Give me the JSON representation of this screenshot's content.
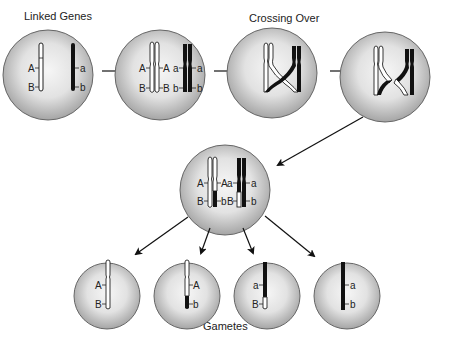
{
  "diagram": {
    "labels": {
      "linked_genes": "Linked Genes",
      "crossing_over": "Crossing Over",
      "gametes": "Gametes"
    },
    "alleles": {
      "A": "A",
      "a": "a",
      "B": "B",
      "b": "b"
    },
    "colors": {
      "cell_fill_center": "#f4f4f4",
      "cell_fill_edge": "#9a9a9a",
      "cell_stroke": "#555555",
      "chromosome_light": "#ffffff",
      "chromosome_dark": "#111111",
      "arrow": "#111111"
    },
    "stages": [
      {
        "id": "cell-1",
        "label": "Linked Genes",
        "desc": "Homologous chromosomes: A-B (light), a-b (dark)"
      },
      {
        "id": "cell-2",
        "desc": "Replicated chromosomes: sister chromatids A-B / A-B and a-b / a-b"
      },
      {
        "id": "cell-3",
        "label": "Crossing Over",
        "desc": "Non-sister chromatids cross"
      },
      {
        "id": "cell-4",
        "desc": "Chromatid segments exchanged"
      },
      {
        "id": "cell-5",
        "desc": "Recombinant chromatids: A-B, A-b, a-B, a-b"
      }
    ],
    "gametes": [
      {
        "top": "A",
        "bottom": "B",
        "type": "parental"
      },
      {
        "top": "A",
        "bottom": "b",
        "type": "recombinant"
      },
      {
        "top": "a",
        "bottom": "B",
        "type": "recombinant"
      },
      {
        "top": "a",
        "bottom": "b",
        "type": "parental"
      }
    ]
  }
}
